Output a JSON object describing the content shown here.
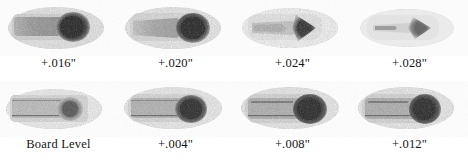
{
  "figure": {
    "rows": 2,
    "columns": 4,
    "background_color": "#ffffff",
    "text_color": "#151515"
  },
  "panels": [
    {
      "id": "panel-top-1",
      "label": "+.016\"",
      "row": 1,
      "column": 1,
      "shape": "bar-with-round-head",
      "body_tone": "#9a9a9a",
      "head_tone": "#1e1e1e",
      "halo_tone": "#d9d9d9",
      "intensity": "high"
    },
    {
      "id": "panel-top-2",
      "label": "+.020\"",
      "row": 1,
      "column": 2,
      "shape": "bar-with-round-head",
      "body_tone": "#a8a8a8",
      "head_tone": "#232323",
      "halo_tone": "#dcdcdc",
      "intensity": "high"
    },
    {
      "id": "panel-top-3",
      "label": "+.024\"",
      "row": 1,
      "column": 3,
      "shape": "tapered-with-triangular-head",
      "body_tone": "#c2c2c2",
      "head_tone": "#3a3a3a",
      "halo_tone": "#e4e4e4",
      "intensity": "medium"
    },
    {
      "id": "panel-top-4",
      "label": "+.028\"",
      "row": 1,
      "column": 4,
      "shape": "tapered-with-triangular-head",
      "body_tone": "#d2d2d2",
      "head_tone": "#6a6a6a",
      "halo_tone": "#ececec",
      "intensity": "low"
    },
    {
      "id": "panel-bottom-1",
      "label": "Board Level",
      "row": 2,
      "column": 1,
      "shape": "bar-with-round-head",
      "body_tone": "#b8b8b8",
      "head_tone": "#6e6e6e",
      "halo_tone": "#e2e2e2",
      "intensity": "low"
    },
    {
      "id": "panel-bottom-2",
      "label": "+.004\"",
      "row": 2,
      "column": 2,
      "shape": "bar-with-round-head",
      "body_tone": "#b0b0b0",
      "head_tone": "#333333",
      "halo_tone": "#e0e0e0",
      "intensity": "medium-high"
    },
    {
      "id": "panel-bottom-3",
      "label": "+.008\"",
      "row": 2,
      "column": 3,
      "shape": "bar-with-round-head",
      "body_tone": "#adadad",
      "head_tone": "#262626",
      "halo_tone": "#dedede",
      "intensity": "high"
    },
    {
      "id": "panel-bottom-4",
      "label": "+.012\"",
      "row": 2,
      "column": 4,
      "shape": "bar-with-round-head",
      "body_tone": "#ababab",
      "head_tone": "#242424",
      "halo_tone": "#dedede",
      "intensity": "high"
    }
  ]
}
